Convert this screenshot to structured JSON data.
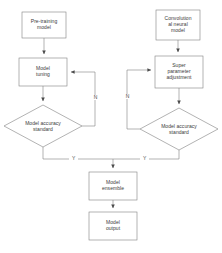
{
  "diagram": {
    "background_color": "#ffffff",
    "stroke_color": "#808080",
    "text_color": "#3a3a3a",
    "nodes": [
      {
        "id": "pretraining",
        "shape": "rectangle",
        "label": "Pre-training\nmodel",
        "line1": "Pre-training",
        "line2": "model"
      },
      {
        "id": "cnn",
        "shape": "rectangle",
        "label": "Convolution\nal neural\nmodel",
        "line1": "Convolution",
        "line2": "al neural",
        "line3": "model"
      },
      {
        "id": "model_tuning",
        "shape": "rectangle",
        "label": "Model\ntuning",
        "line1": "Model",
        "line2": "tuning"
      },
      {
        "id": "super_param",
        "shape": "rectangle",
        "label": "Super\nparameter\nadjustment",
        "line1": "Super",
        "line2": "parameter",
        "line3": "adjustment"
      },
      {
        "id": "decision_left",
        "shape": "diamond",
        "label": "Model accuracy\nstandard",
        "line1": "Model accuracy",
        "line2": "standard"
      },
      {
        "id": "decision_right",
        "shape": "diamond",
        "label": "Model accuracy\nstandard",
        "line1": "Model accuracy",
        "line2": "standard"
      },
      {
        "id": "model_ensemble",
        "shape": "rectangle",
        "label": "Model\nensemble",
        "line1": "Model",
        "line2": "ensemble"
      },
      {
        "id": "model_output",
        "shape": "rectangle",
        "label": "Model\noutput",
        "line1": "Model",
        "line2": "output"
      }
    ],
    "edge_labels": {
      "left_no": "N",
      "right_no": "N",
      "left_yes": "Y",
      "right_yes": "Y"
    }
  }
}
